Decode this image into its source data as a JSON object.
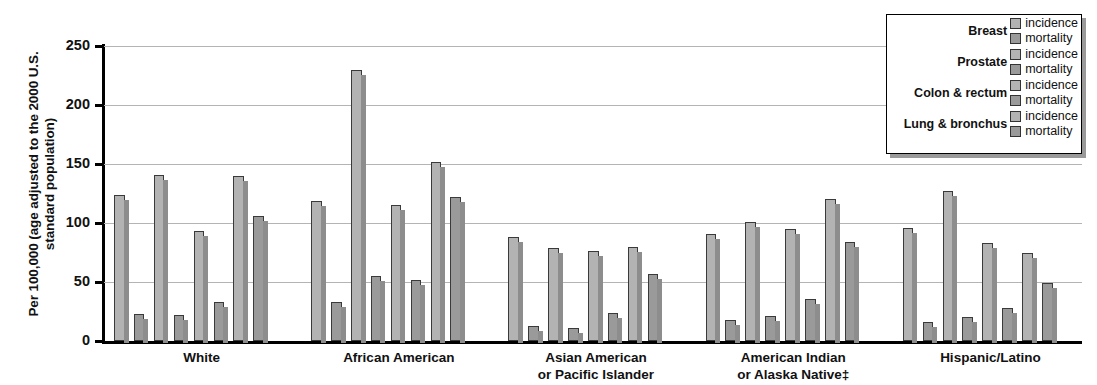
{
  "chart_data": {
    "type": "bar",
    "title": "",
    "ylabel": "Per 100,000 (age adjusted to the 2000 U.S. standard population)",
    "xlabel": "",
    "ylim": [
      0,
      250
    ],
    "yticks": [
      0,
      50,
      100,
      150,
      200,
      250
    ],
    "grid": true,
    "legend_position": "top-right",
    "categories": [
      "White",
      "African American",
      "Asian American or Pacific Islander",
      "American Indian or Alaska Native‡",
      "Hispanic/Latino"
    ],
    "category_lines": [
      [
        "White",
        ""
      ],
      [
        "African American",
        ""
      ],
      [
        "Asian American",
        "or Pacific Islander"
      ],
      [
        "American Indian",
        "or Alaska Native‡"
      ],
      [
        "Hispanic/Latino",
        ""
      ]
    ],
    "series": [
      {
        "name": "Breast incidence",
        "cancer": "Breast",
        "kind": "incidence",
        "values": [
          124,
          119,
          88,
          91,
          96
        ]
      },
      {
        "name": "Breast mortality",
        "cancer": "Breast",
        "kind": "mortality",
        "values": [
          23,
          33,
          13,
          18,
          16
        ]
      },
      {
        "name": "Prostate incidence",
        "cancer": "Prostate",
        "kind": "incidence",
        "values": [
          141,
          230,
          79,
          101,
          127
        ]
      },
      {
        "name": "Prostate mortality",
        "cancer": "Prostate",
        "kind": "mortality",
        "values": [
          22,
          55,
          11,
          21,
          20
        ]
      },
      {
        "name": "Colon & rectum incidence",
        "cancer": "Colon & rectum",
        "kind": "incidence",
        "values": [
          93,
          115,
          76,
          95,
          83
        ]
      },
      {
        "name": "Colon & rectum mortality",
        "cancer": "Colon & rectum",
        "kind": "mortality",
        "values": [
          33,
          52,
          24,
          36,
          28
        ]
      },
      {
        "name": "Lung & bronchus incidence",
        "cancer": "Lung & bronchus",
        "kind": "incidence",
        "values": [
          140,
          152,
          80,
          120,
          75
        ]
      },
      {
        "name": "Lung & bronchus mortality",
        "cancer": "Lung & bronchus",
        "kind": "mortality",
        "values": [
          106,
          122,
          57,
          84,
          49
        ]
      }
    ],
    "colors": {
      "incidence": "#b3b3b3",
      "mortality": "#9a9a9a",
      "bar_outline": "#3a3a3a",
      "axis": "#000000",
      "gridline": "#b4b4b4"
    }
  },
  "legend": {
    "rows": [
      {
        "cancer": "Breast",
        "incidence_label": "incidence",
        "mortality_label": "mortality"
      },
      {
        "cancer": "Prostate",
        "incidence_label": "incidence",
        "mortality_label": "mortality"
      },
      {
        "cancer": "Colon & rectum",
        "incidence_label": "incidence",
        "mortality_label": "mortality"
      },
      {
        "cancer": "Lung & bronchus",
        "incidence_label": "incidence",
        "mortality_label": "mortality"
      }
    ]
  }
}
